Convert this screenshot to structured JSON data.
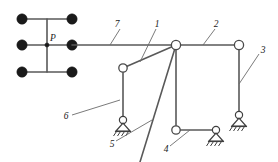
{
  "diagram": {
    "type": "structural-frame-schematic",
    "title": "",
    "load_label": "P",
    "member_labels": [
      {
        "id": "1",
        "text": "1",
        "x": 157,
        "y": 25
      },
      {
        "id": "2",
        "text": "2",
        "x": 216,
        "y": 25
      },
      {
        "id": "3",
        "text": "3",
        "x": 262,
        "y": 52
      },
      {
        "id": "4",
        "text": "4",
        "x": 167,
        "y": 150
      },
      {
        "id": "5",
        "text": "5",
        "x": 113,
        "y": 146
      },
      {
        "id": "6",
        "text": "6",
        "x": 66,
        "y": 118
      },
      {
        "id": "7",
        "text": "7",
        "x": 121,
        "y": 25
      }
    ],
    "grid_nodes": [
      {
        "x": 22,
        "y": 19
      },
      {
        "x": 72,
        "y": 19
      },
      {
        "x": 22,
        "y": 45
      },
      {
        "x": 72,
        "y": 45
      },
      {
        "x": 22,
        "y": 72
      },
      {
        "x": 72,
        "y": 72
      }
    ],
    "joints": [
      {
        "name": "left-joint",
        "x": 123,
        "y": 68
      },
      {
        "name": "top-main-joint",
        "x": 176,
        "y": 45
      },
      {
        "name": "top-right-joint",
        "x": 239,
        "y": 45
      },
      {
        "name": "bottom-mid-joint",
        "x": 176,
        "y": 130
      }
    ],
    "supports": [
      {
        "name": "support-5",
        "x": 123,
        "y": 122
      },
      {
        "name": "support-4",
        "x": 216,
        "y": 130
      },
      {
        "name": "support-3",
        "x": 239,
        "y": 118
      }
    ],
    "colors": {
      "member": "#595959",
      "leader": "#6b6b6b",
      "node": "#1a1a1a",
      "background": "#ffffff"
    }
  }
}
